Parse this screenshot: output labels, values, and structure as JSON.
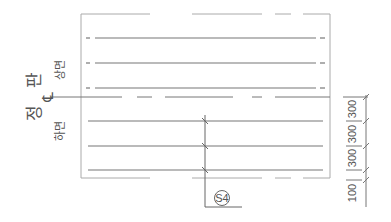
{
  "diagram": {
    "title": "정 판",
    "centerline_symbol": "℄",
    "upper_face_label": "상면",
    "lower_face_label": "하면",
    "section_tag": "S4",
    "dimensions": [
      {
        "value": "300",
        "from_y": 97,
        "to_y": 121
      },
      {
        "value": "300",
        "from_y": 121,
        "to_y": 146
      },
      {
        "value": "300",
        "from_y": 146,
        "to_y": 170
      },
      {
        "value": "100",
        "from_y": 180,
        "to_y": 206
      }
    ],
    "colors": {
      "line": "#777777",
      "frame": "#aaaaaa",
      "text": "#555555"
    }
  }
}
